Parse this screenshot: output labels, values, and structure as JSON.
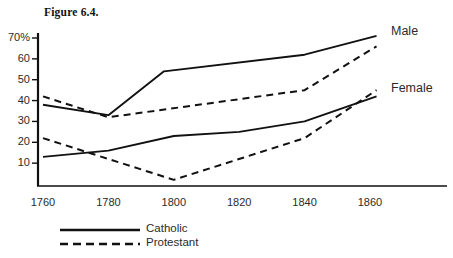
{
  "figure": {
    "title": "Figure 6.4."
  },
  "axes": {
    "y_ticks": [
      {
        "label": "70%",
        "value": 70
      },
      {
        "label": "60",
        "value": 60
      },
      {
        "label": "50",
        "value": 50
      },
      {
        "label": "40",
        "value": 40
      },
      {
        "label": "30",
        "value": 30
      },
      {
        "label": "20",
        "value": 20
      },
      {
        "label": "10",
        "value": 10
      }
    ],
    "x_ticks": [
      {
        "label": "1760",
        "value": 1760
      },
      {
        "label": "1780",
        "value": 1780
      },
      {
        "label": "1800",
        "value": 1800
      },
      {
        "label": "1820",
        "value": 1820
      },
      {
        "label": "1840",
        "value": 1840
      },
      {
        "label": "1860",
        "value": 1860
      }
    ]
  },
  "group_labels": {
    "male": "Male",
    "female": "Female"
  },
  "legend": {
    "items": [
      {
        "label": "Catholic",
        "style": "solid"
      },
      {
        "label": "Protestant",
        "style": "dashed"
      }
    ]
  },
  "colors": {
    "line": "#111111",
    "axis": "#111111",
    "text": "#2b2b2b",
    "background": "#ffffff"
  },
  "chart_data": {
    "type": "line",
    "title": "Figure 6.4.",
    "xlabel": "",
    "ylabel": "",
    "xlim": [
      1755,
      1880
    ],
    "ylim": [
      0,
      72
    ],
    "grid": false,
    "legend_position": "bottom-left",
    "x_tick_labels": [
      "1760",
      "1780",
      "1800",
      "1820",
      "1840",
      "1860"
    ],
    "y_tick_labels": [
      "10",
      "20",
      "30",
      "40",
      "50",
      "60",
      "70%"
    ],
    "series": [
      {
        "name": "Catholic Male",
        "group": "Male",
        "denomination": "Catholic",
        "style": "solid",
        "x": [
          1760,
          1780,
          1797,
          1840,
          1862
        ],
        "values": [
          38,
          33,
          54,
          62,
          71
        ]
      },
      {
        "name": "Protestant Male",
        "group": "Male",
        "denomination": "Protestant",
        "style": "dashed",
        "x": [
          1760,
          1780,
          1840,
          1862
        ],
        "values": [
          42,
          32,
          45,
          66
        ]
      },
      {
        "name": "Catholic Female",
        "group": "Female",
        "denomination": "Catholic",
        "style": "solid",
        "x": [
          1760,
          1780,
          1800,
          1820,
          1840,
          1862
        ],
        "values": [
          13,
          16,
          23,
          25,
          30,
          42
        ]
      },
      {
        "name": "Protestant Female",
        "group": "Female",
        "denomination": "Protestant",
        "style": "dashed",
        "x": [
          1760,
          1800,
          1840,
          1862
        ],
        "values": [
          22,
          2,
          22,
          45
        ]
      }
    ],
    "annotations": [
      {
        "text": "Male",
        "x": 1868,
        "y": 69
      },
      {
        "text": "Female",
        "x": 1868,
        "y": 43
      }
    ]
  }
}
